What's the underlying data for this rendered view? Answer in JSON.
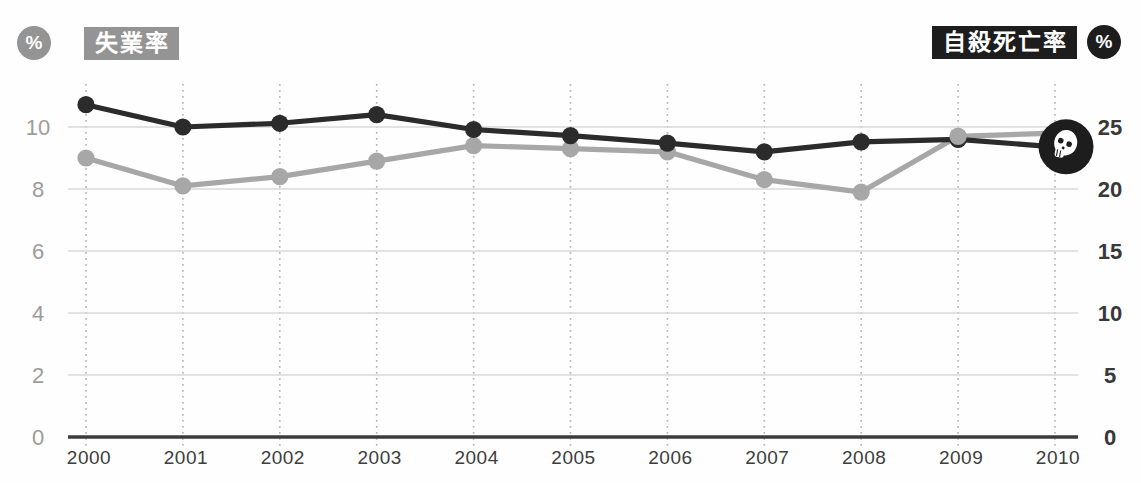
{
  "page": {
    "background": "#fefefe"
  },
  "legend": {
    "left": {
      "unit_symbol": "%",
      "label": "失業率",
      "badge_color": "#949494",
      "text_color": "#ffffff"
    },
    "right": {
      "unit_symbol": "%",
      "label": "自殺死亡率",
      "badge_color": "#1d1d1d",
      "text_color": "#ffffff"
    }
  },
  "chart_data": {
    "type": "line",
    "x": [
      2000,
      2001,
      2002,
      2003,
      2004,
      2005,
      2006,
      2007,
      2008,
      2009,
      2010
    ],
    "series": [
      {
        "name": "失業率",
        "axis": "left",
        "color": "#a7a7a7",
        "values": [
          9.0,
          8.1,
          8.4,
          8.9,
          9.4,
          9.3,
          9.2,
          8.3,
          7.9,
          9.7,
          9.8
        ]
      },
      {
        "name": "自殺死亡率",
        "axis": "right",
        "color": "#2b2b2b",
        "values": [
          26.8,
          25.0,
          25.3,
          26.0,
          24.8,
          24.3,
          23.7,
          23.0,
          23.8,
          24.0,
          23.4
        ],
        "end_marker": "skull-icon"
      }
    ],
    "left_axis": {
      "unit": "%",
      "ticks": [
        0,
        2,
        4,
        6,
        8,
        10
      ],
      "range": [
        0,
        10
      ],
      "label_color": "#9c9c9c"
    },
    "right_axis": {
      "unit": "%",
      "ticks": [
        0,
        5,
        10,
        15,
        20,
        25
      ],
      "range": [
        0,
        25
      ],
      "label_color": "#383838"
    },
    "grid": {
      "horizontal": "solid",
      "vertical": "dotted-per-year"
    },
    "colors": {
      "hgrid": "#d8d8d8",
      "vgrid": "#b5b5b5",
      "axis_line": "#3c3c3c",
      "skull_bg": "#1d1d1d",
      "skull_fg": "#ffffff"
    }
  }
}
